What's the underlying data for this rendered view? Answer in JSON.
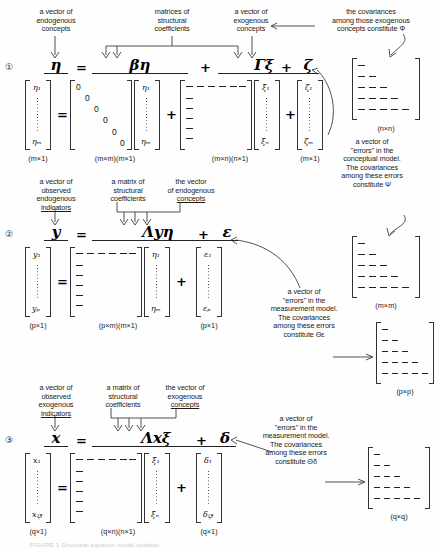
{
  "figure": {
    "bottom_caption": "FIGURE 1  Structural equation model notation"
  },
  "equations": [
    {
      "number": "①",
      "labels": [
        {
          "id": "endogenous-concepts",
          "lines": [
            "a vector of",
            "endogenous",
            "concepts"
          ],
          "underline_last": false
        },
        {
          "id": "structural-coefficients",
          "lines": [
            "matrices of",
            "structural",
            "coefficients"
          ],
          "underline_last": false
        },
        {
          "id": "exogenous-concepts",
          "lines": [
            "a vector of",
            "exogenous",
            "concepts"
          ],
          "underline_last": false
        },
        {
          "id": "phi-covariances",
          "lines": [
            "the covariances",
            "among those exogenous",
            "concepts constitute Φ"
          ],
          "underline_last": false
        }
      ],
      "terms": [
        {
          "symbol": "η",
          "op": "="
        },
        {
          "symbol": "βη",
          "op": "+"
        },
        {
          "symbol": "Γξ",
          "op": "+"
        },
        {
          "symbol": "ζ",
          "op": ""
        }
      ],
      "matrices": [
        {
          "id": "eta-vector",
          "top": "η₁",
          "bottom": "ηₘ",
          "dim": "(m×1)"
        },
        {
          "id": "beta-matrix",
          "dim": "(m×m)",
          "pattern": "zero-diagonal",
          "zeros": 6
        },
        {
          "id": "eta-vector-2",
          "top": "η₁",
          "bottom": "ηₘ",
          "dim": "(m×1)"
        },
        {
          "id": "gamma-matrix",
          "dim": "(m×n)",
          "pattern": "top-row-and-left-col-dashes"
        },
        {
          "id": "xi-vector",
          "top": "ξ₁",
          "bottom": "ξₙ",
          "dim": "(n×1)"
        },
        {
          "id": "zeta-vector",
          "top": "ζ₁",
          "bottom": "ζₘ",
          "dim": "(m×1)"
        },
        {
          "id": "phi-matrix",
          "dim": "(n×n)",
          "pattern": "lower-triangular"
        }
      ],
      "dim_groups": [
        "(m×1)",
        "(m×m)(m×1)",
        "(m×n)(n×1)",
        "(m×1)",
        "(n×n)"
      ]
    },
    {
      "number": "②",
      "labels": [
        {
          "id": "observed-endogenous-indicators",
          "lines": [
            "a vector of",
            "observed",
            "endogenous",
            "indicators"
          ],
          "underline_last": true
        },
        {
          "id": "structural-coefficients-2",
          "lines": [
            "a matrix of",
            "structural",
            "coefficients"
          ],
          "underline_last": false
        },
        {
          "id": "vector-endogenous-concepts",
          "lines": [
            "the vector",
            "of endogenous",
            "concepts"
          ],
          "underline_last": true
        },
        {
          "id": "psi-covariances",
          "lines": [
            "a vector of",
            "\"errors\" in the",
            "conceptual model.",
            "The covariances",
            "among these errors",
            "constitute Ψ"
          ],
          "underline_last": false
        },
        {
          "id": "theta-eps-covariances",
          "lines": [
            "a vector of",
            "\"errors\" in the",
            "measurement model.",
            "The covariances",
            "among these errors",
            "constitute Θε"
          ],
          "underline_last": false
        }
      ],
      "terms": [
        {
          "symbol": "y",
          "op": "="
        },
        {
          "symbol": "Λyη",
          "op": "+"
        },
        {
          "symbol": "ε",
          "op": ""
        }
      ],
      "matrices": [
        {
          "id": "y-vector",
          "top": "y₁",
          "bottom": "yₚ",
          "dim": "(p×1)"
        },
        {
          "id": "lambda-y-matrix",
          "dim": "(p×m)",
          "pattern": "top-row-and-left-col-dashes"
        },
        {
          "id": "eta-vector-3",
          "top": "η₁",
          "bottom": "ηₘ",
          "dim": "(m×1)"
        },
        {
          "id": "epsilon-vector",
          "top": "ε₁",
          "bottom": "εₚ",
          "dim": "(p×1)"
        },
        {
          "id": "psi-matrix",
          "dim": "(m×m)",
          "pattern": "lower-triangular"
        },
        {
          "id": "theta-eps-matrix",
          "dim": "(p×p)",
          "pattern": "lower-triangular"
        }
      ],
      "dim_groups": [
        "(p×1)",
        "(p×m)(m×1)",
        "(p×1)",
        "(m×m)",
        "(p×p)"
      ]
    },
    {
      "number": "③",
      "labels": [
        {
          "id": "observed-exogenous-indicators",
          "lines": [
            "a vector of",
            "observed",
            "exogenous",
            "indicators"
          ],
          "underline_last": true
        },
        {
          "id": "structural-coefficients-3",
          "lines": [
            "a matrix of",
            "structural",
            "coefficients"
          ],
          "underline_last": false
        },
        {
          "id": "vector-exogenous-concepts",
          "lines": [
            "the vector of",
            "exogenous",
            "concepts"
          ],
          "underline_last": true
        },
        {
          "id": "theta-delta-covariances",
          "lines": [
            "a vector of",
            "\"errors\" in the",
            "measurement model.",
            "The covariances",
            "among these errors",
            "constitute Θδ"
          ],
          "underline_last": false
        }
      ],
      "terms": [
        {
          "symbol": "x",
          "op": "="
        },
        {
          "symbol": "Λxξ",
          "op": "+"
        },
        {
          "symbol": "δ",
          "op": ""
        }
      ],
      "matrices": [
        {
          "id": "x-vector",
          "top": "x₁",
          "bottom": "xࢵ",
          "dim": "(q×1)"
        },
        {
          "id": "lambda-x-matrix",
          "dim": "(q×n)",
          "pattern": "top-row-and-left-col-dashes"
        },
        {
          "id": "xi-vector-2",
          "top": "ξ₁",
          "bottom": "ξₙ",
          "dim": "(n×1)"
        },
        {
          "id": "delta-vector",
          "top": "δ₁",
          "bottom": "δࢵ",
          "dim": "(q×1)"
        },
        {
          "id": "theta-delta-matrix",
          "dim": "(q×q)",
          "pattern": "lower-triangular"
        }
      ],
      "dim_groups": [
        "(q×1)",
        "(q×n)(n×1)",
        "(q×1)",
        "(q×q)"
      ]
    }
  ],
  "symbols": {
    "eta": "η",
    "beta": "β",
    "gamma_cap": "Γ",
    "xi": "ξ",
    "zeta": "ζ",
    "phi_cap": "Φ",
    "psi_cap": "Ψ",
    "lambda_cap": "Λ",
    "epsilon": "ε",
    "delta": "δ",
    "theta_cap": "Θ",
    "eq_plus": "+",
    "eq_equals": "=",
    "y": "y",
    "x": "x"
  },
  "colors": {
    "ink": "#1a1a1a",
    "rule": "#333333",
    "background": "#fefefe"
  }
}
